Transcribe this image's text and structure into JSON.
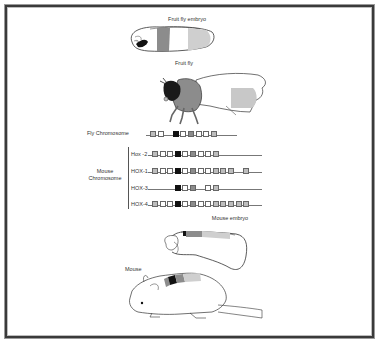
{
  "figure": {
    "labels": {
      "fruit_fly_embryo": "Fruit fly embryo",
      "fruit_fly": "Fruit fly",
      "fly_chromosome": "Fly Chromosome",
      "mouse_chromosome": "Mouse\nChromosome",
      "mouse_chromosome_line1": "Mouse",
      "mouse_chromosome_line2": "Chromosome",
      "mouse_embryo": "Mouse embryo",
      "mouse": "Mouse"
    },
    "colors": {
      "white": "#ffffff",
      "light_gray": "#bdbdbd",
      "mid_gray": "#8c8c8c",
      "black": "#111111",
      "outline": "#666666"
    },
    "chromosomes": [
      {
        "name": "Fly",
        "label": "",
        "genes": [
          "light",
          "white",
          "gap",
          "black",
          "white",
          "mid",
          "white",
          "white",
          "light"
        ],
        "line_end": 237
      },
      {
        "name": "Hox-2",
        "label": "Hox -2",
        "genes": [
          "light",
          "white",
          "white",
          "black",
          "white",
          "mid",
          "white",
          "white",
          "light"
        ],
        "line_end": 262
      },
      {
        "name": "HOX-1",
        "label": "HOX-1",
        "genes": [
          "light",
          "white",
          "white",
          "black",
          "white",
          "mid",
          "white",
          "white",
          "light",
          "light",
          "light",
          "gap",
          "light"
        ],
        "line_end": 262
      },
      {
        "name": "HOX-3",
        "label": "HOX-3",
        "genes": [
          "none",
          "none",
          "none",
          "black",
          "white",
          "mid",
          "gap",
          "white",
          "light"
        ],
        "line_end": 262
      },
      {
        "name": "HOX-4",
        "label": "HOX-4",
        "genes": [
          "light",
          "white",
          "white",
          "black",
          "white",
          "mid",
          "white",
          "white",
          "light",
          "light",
          "light",
          "light",
          "light"
        ],
        "line_end": 262
      }
    ]
  }
}
